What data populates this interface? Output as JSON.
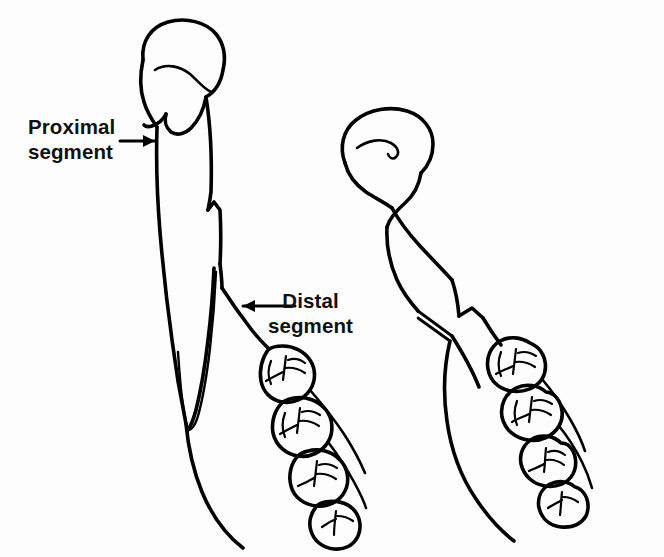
{
  "figure": {
    "kind": "line-drawing",
    "background_color": "#fdfdfd",
    "ink_color": "#000000",
    "width": 664,
    "height": 557
  },
  "annotations": [
    {
      "id": "proximal",
      "line1": "Proximal",
      "line2": "segment",
      "arrow_direction": "right",
      "arrow_icon": "arrow-right-icon"
    },
    {
      "id": "distal",
      "line1": "Distal",
      "line2": "segment",
      "arrow_direction": "left",
      "arrow_icon": "arrow-left-icon"
    }
  ],
  "views": [
    {
      "id": "left-view",
      "name": "left-mandible-view",
      "parts": [
        "condyle-head",
        "condylar-neck",
        "ramus",
        "fracture-line",
        "displaced-proximal-sliver",
        "mandibular-body",
        "molar-teeth"
      ],
      "tooth_count": 4
    },
    {
      "id": "right-view",
      "name": "right-mandible-view",
      "parts": [
        "condyle-head",
        "condylar-neck",
        "ramus",
        "fracture-line",
        "mandibular-body",
        "molar-teeth"
      ],
      "tooth_count": 4
    }
  ]
}
